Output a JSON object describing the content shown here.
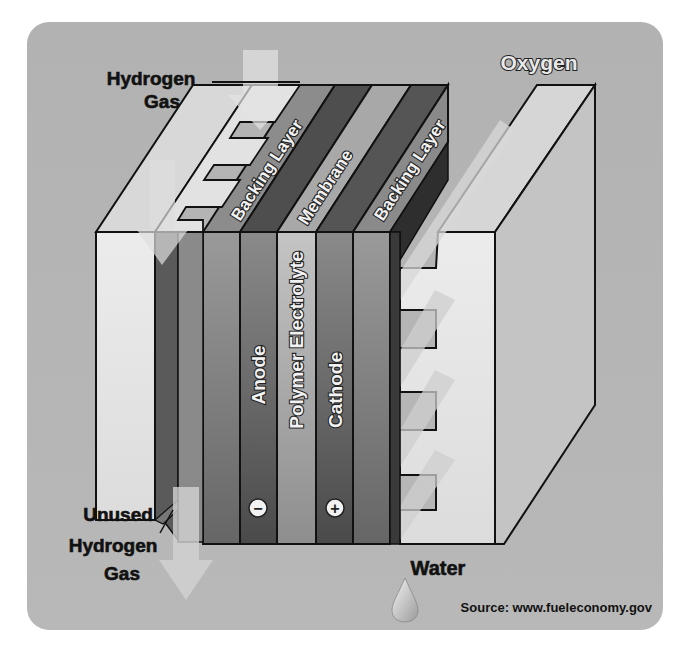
{
  "diagram": {
    "labels": {
      "hydrogen_in_line1": "Hydrogen",
      "hydrogen_in_line2": "Gas",
      "oxygen": "Oxygen",
      "backing_layer_anode": "Backing Layer",
      "membrane": "Membrane",
      "backing_layer_cathode": "Backing Layer",
      "anode": "Anode",
      "polymer_electrolyte": "Polymer Electrolyte",
      "cathode": "Cathode",
      "unused_line1": "Unused",
      "unused_line2": "Hydrogen",
      "unused_line3": "Gas",
      "water": "Water",
      "source": "Source: www.fueleconomy.gov"
    },
    "symbols": {
      "anode_polarity": "−",
      "cathode_polarity": "+"
    },
    "icons": [
      "hydrogen-flow-arrow",
      "oxygen-flow-arrow",
      "unused-hydrogen-arrow",
      "water-droplet-icon",
      "minus-icon",
      "plus-icon"
    ],
    "colors": {
      "panel_background": "#b4b4b4",
      "plate_light": "#e6e6e6",
      "layer_dark": "#5a5a5a",
      "layer_mid": "#8a8a8a",
      "layer_light": "#a8a8a8",
      "outline": "#111111"
    }
  }
}
